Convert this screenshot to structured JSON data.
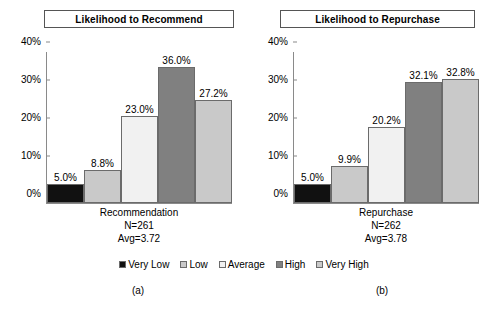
{
  "chart_data": [
    {
      "type": "bar",
      "title": "Likelihood to Recommend",
      "subfigure_label": "(a)",
      "categories": [
        "Very Low",
        "Low",
        "Average",
        "High",
        "Very High"
      ],
      "values": [
        5.0,
        8.8,
        23.0,
        36.0,
        27.2
      ],
      "value_labels": [
        "5.0%",
        "8.8%",
        "23.0%",
        "36.0%",
        "27.2%"
      ],
      "xlabel": "Recommendation",
      "x_caption_lines": [
        "Recommendation",
        "N=261",
        "Avg=3.72"
      ],
      "n": "N=261",
      "avg": "Avg=3.72",
      "ylabel": "",
      "ylim": [
        0,
        40
      ],
      "yticks": [
        0,
        10,
        20,
        30,
        40
      ],
      "ytick_labels": [
        "0%",
        "10%",
        "20%",
        "30%",
        "40%"
      ],
      "grid": false,
      "legend_position": "bottom-center-shared"
    },
    {
      "type": "bar",
      "title": "Likelihood to Repurchase",
      "subfigure_label": "(b)",
      "categories": [
        "Very Low",
        "Low",
        "Average",
        "High",
        "Very High"
      ],
      "values": [
        5.0,
        9.9,
        20.2,
        32.1,
        32.8
      ],
      "value_labels": [
        "5.0%",
        "9.9%",
        "20.2%",
        "32.1%",
        "32.8%"
      ],
      "xlabel": "Repurchase",
      "x_caption_lines": [
        "Repurchase",
        "N=262",
        "Avg=3.78"
      ],
      "n": "N=262",
      "avg": "Avg=3.78",
      "ylabel": "",
      "ylim": [
        0,
        40
      ],
      "yticks": [
        0,
        10,
        20,
        30,
        40
      ],
      "ytick_labels": [
        "0%",
        "10%",
        "20%",
        "30%",
        "40%"
      ],
      "grid": false,
      "legend_position": "bottom-center-shared"
    }
  ],
  "legend": {
    "items": [
      {
        "label": "Very Low",
        "color": "#111111"
      },
      {
        "label": "Low",
        "color": "#c9c9c9"
      },
      {
        "label": "Average",
        "color": "#f1f1f1"
      },
      {
        "label": "High",
        "color": "#808080"
      },
      {
        "label": "Very High",
        "color": "#c9c9c9"
      }
    ]
  },
  "colors": {
    "very_low": "#111111",
    "low": "#c9c9c9",
    "average": "#f1f1f1",
    "high": "#808080",
    "very_high": "#c9c9c9",
    "axis": "#8a8a8a",
    "bar_outline": "#6b6b6b",
    "background": "#ffffff",
    "text": "#000000"
  }
}
